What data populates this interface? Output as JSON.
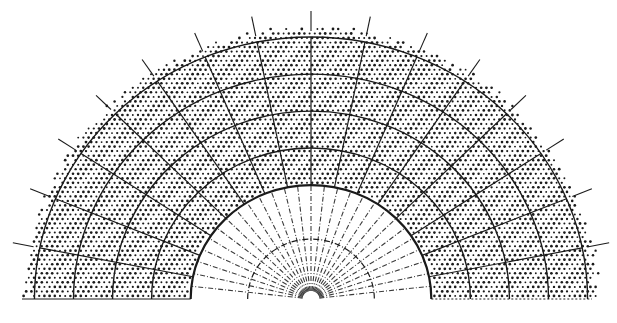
{
  "figure": {
    "type": "half-disc polar grid diagram",
    "width": 617,
    "height": 323,
    "background": "#ffffff",
    "ink_color": "#1a1a1a",
    "center": {
      "x": 311,
      "y": 299
    },
    "inner_region": {
      "description": "unstippled inner half-disc with dashed radial and arc lines",
      "radius": 114,
      "dashed_arc_radii": [
        60
      ],
      "spoke_count": 28
    },
    "stippled_region": {
      "description": "dot-stippled annulus between inner half-disc and outer boundary",
      "inner_radius": 114,
      "outer_radius_x": 285,
      "outer_radius_y": 270,
      "dot_spacing": 5.2
    },
    "solid_arc_radii": [
      114,
      151,
      188,
      225,
      262
    ],
    "outer_spoke_count": 17,
    "outer_tick_length": 18,
    "baseline_left_x": 22,
    "baseline_right_x": 592,
    "labels": []
  }
}
